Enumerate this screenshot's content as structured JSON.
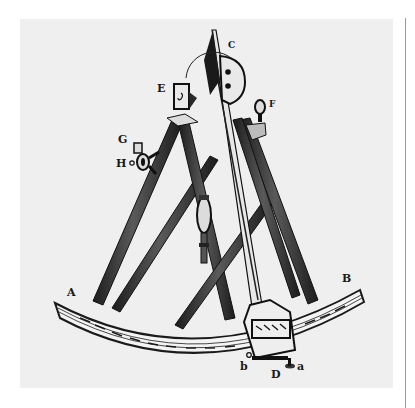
{
  "figure": {
    "colors": {
      "background": "#ffffff",
      "panel": "#efefef",
      "ink": "#1a1a1a",
      "frame_wood": "#3a3a3a",
      "rule": "#9a9a9a"
    },
    "labels": {
      "A": "A",
      "B": "B",
      "C": "C",
      "D": "D",
      "E": "E",
      "F": "F",
      "G": "G",
      "H": "H",
      "a": "a",
      "b": "b"
    }
  }
}
